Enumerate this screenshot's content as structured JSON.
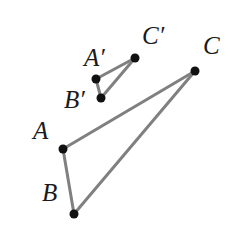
{
  "figure": {
    "width": 237,
    "height": 230,
    "background_color": "#ffffff",
    "edge_color": "#808080",
    "edge_width": 3,
    "vertex_color": "#111111",
    "vertex_radius": 4.5,
    "label_color": "#1a1a1a"
  },
  "labels": {
    "A": "A",
    "B": "B",
    "C": "C",
    "A_prime": "A′",
    "B_prime": "B′",
    "C_prime": "C′"
  },
  "chart_data": {
    "type": "scatter",
    "xlabel": "",
    "ylabel": "",
    "xlim": [
      0,
      237
    ],
    "ylim": [
      0,
      230
    ],
    "grid": false,
    "legend": "none",
    "points": [
      {
        "name": "A",
        "label": "A",
        "x": 63,
        "y": 149,
        "label_x": 33,
        "label_y": 118
      },
      {
        "name": "B",
        "label": "B",
        "x": 74,
        "y": 214,
        "label_x": 42,
        "label_y": 180
      },
      {
        "name": "C",
        "label": "C",
        "x": 195,
        "y": 71,
        "label_x": 203,
        "label_y": 33
      },
      {
        "name": "A'",
        "label": "A′",
        "x": 96,
        "y": 79,
        "label_x": 84,
        "label_y": 45
      },
      {
        "name": "B'",
        "label": "B′",
        "x": 101,
        "y": 98,
        "label_x": 64,
        "label_y": 87
      },
      {
        "name": "C'",
        "label": "C′",
        "x": 135,
        "y": 58,
        "label_x": 142,
        "label_y": 23
      }
    ],
    "edges": [
      {
        "name": "segment-AB",
        "from": "A",
        "to": "B"
      },
      {
        "name": "segment-AC",
        "from": "A",
        "to": "C"
      },
      {
        "name": "segment-BC",
        "from": "B",
        "to": "C"
      },
      {
        "name": "segment-A'B'",
        "from": "A'",
        "to": "B'"
      },
      {
        "name": "segment-A'C'",
        "from": "A'",
        "to": "C'"
      },
      {
        "name": "segment-B'C'",
        "from": "B'",
        "to": "C'"
      }
    ]
  }
}
